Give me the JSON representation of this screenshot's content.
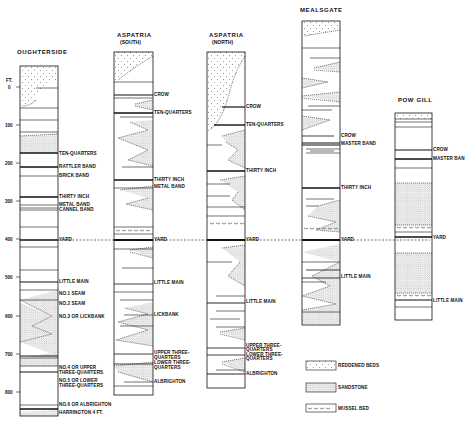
{
  "diagram": {
    "scale": {
      "unit": "FT.",
      "ticks": [
        "0",
        "100",
        "200",
        "300",
        "400",
        "500",
        "600",
        "700",
        "800"
      ]
    },
    "columns": [
      {
        "id": "oughterside",
        "title": "OUGHTERSIDE",
        "subtitle": "",
        "labels": [
          "TEN-QUARTERS",
          "RATTLER BAND",
          "BRICK BAND",
          "THIRTY INCH",
          "METAL BAND",
          "CANNEL BAND",
          "YARD",
          "LITTLE MAIN",
          "NO.1 SEAM",
          "NO.2 SEAM",
          "NO.3 OR LICKBANK",
          "NO.4 OR UPPER",
          "THREE-QUARTERS",
          "NO.5 OR LOWER",
          "THREE-QUARTERS",
          "NO.6 OR ALBRIGHTON",
          "HARRINGTON 4 FT."
        ]
      },
      {
        "id": "aspatria-south",
        "title": "ASPATRIA",
        "subtitle": "(SOUTH)",
        "labels": [
          "CROW",
          "TEN-QUARTERS",
          "THIRTY INCH",
          "METAL BAND",
          "YARD",
          "LITTLE MAIN",
          "LICKBANK",
          "UPPER THREE-",
          "QUARTERS",
          "LOWER THREE-",
          "QUARTERS",
          "ALBRIGHTON"
        ]
      },
      {
        "id": "aspatria-north",
        "title": "ASPATRIA",
        "subtitle": "(NORTH)",
        "labels": [
          "CROW",
          "TEN-QUARTERS",
          "THIRTY INCH",
          "YARD",
          "LITTLE MAIN",
          "UPPER THREE-",
          "QUARTERS",
          "LOWER THREE-",
          "QUARTERS",
          "ALBRIGHTON"
        ]
      },
      {
        "id": "mealsgate",
        "title": "MEALSGATE",
        "subtitle": "",
        "labels": [
          "CROW",
          "MASTER BAND",
          "THIRTY INCH",
          "YARD",
          "LITTLE MAIN"
        ]
      },
      {
        "id": "pow-gill",
        "title": "POW GILL",
        "subtitle": "",
        "labels": [
          "CROW",
          "MASTER BAN",
          "YARD",
          "LITTLE MAIN"
        ]
      }
    ],
    "legend": [
      {
        "label": "REDDENED BEDS",
        "pattern": "reddened"
      },
      {
        "label": "SANDSTONE",
        "pattern": "sandstone"
      },
      {
        "label": "MUSSEL BED",
        "pattern": "mussel"
      }
    ],
    "correlation_line": "YARD"
  }
}
